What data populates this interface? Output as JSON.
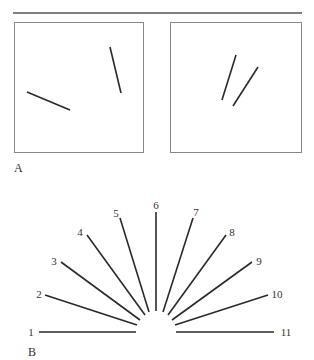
{
  "figure": {
    "top_rule": {
      "x1": 13,
      "y1": 13,
      "x2": 302,
      "y2": 13,
      "color": "#555555",
      "width": 1.3
    },
    "panel_a": {
      "label": "A",
      "label_pos": {
        "x": 14,
        "y": 172
      },
      "boxes": [
        {
          "name": "left-stimulus-box",
          "x": 14.5,
          "y": 22.5,
          "w": 129,
          "h": 130,
          "lines": [
            {
              "x1": 27,
              "y1": 92,
              "x2": 70,
              "y2": 110
            },
            {
              "x1": 110,
              "y1": 47,
              "x2": 121,
              "y2": 93
            }
          ]
        },
        {
          "name": "right-stimulus-box",
          "x": 170.5,
          "y": 22.5,
          "w": 131,
          "h": 130,
          "lines": [
            {
              "x1": 236,
              "y1": 55,
              "x2": 222,
              "y2": 100
            },
            {
              "x1": 258,
              "y1": 67,
              "x2": 233,
              "y2": 106
            }
          ]
        }
      ],
      "box_color": "#888888",
      "line_color": "#2a2a2a"
    },
    "panel_b": {
      "label": "B",
      "label_pos": {
        "x": 28,
        "y": 356
      },
      "line_color": "#2a2a2a",
      "fan_lines": [
        {
          "id": "1",
          "x1": 39,
          "y1": 332,
          "x2": 136,
          "y2": 332,
          "lx": 31,
          "ly": 336
        },
        {
          "id": "2",
          "x1": 45,
          "y1": 295,
          "x2": 137,
          "y2": 325,
          "lx": 39,
          "ly": 298
        },
        {
          "id": "3",
          "x1": 61,
          "y1": 262,
          "x2": 140,
          "y2": 320,
          "lx": 54,
          "ly": 265
        },
        {
          "id": "4",
          "x1": 87,
          "y1": 235,
          "x2": 145,
          "y2": 315,
          "lx": 80,
          "ly": 236
        },
        {
          "id": "5",
          "x1": 120,
          "y1": 218,
          "x2": 149,
          "y2": 312,
          "lx": 116,
          "ly": 217
        },
        {
          "id": "6",
          "x1": 156,
          "y1": 212,
          "x2": 156,
          "y2": 311,
          "lx": 156,
          "ly": 209
        },
        {
          "id": "7",
          "x1": 193,
          "y1": 218,
          "x2": 163,
          "y2": 312,
          "lx": 196,
          "ly": 216
        },
        {
          "id": "8",
          "x1": 226,
          "y1": 235,
          "x2": 168,
          "y2": 315,
          "lx": 232,
          "ly": 236
        },
        {
          "id": "9",
          "x1": 252,
          "y1": 262,
          "x2": 172,
          "y2": 320,
          "lx": 259,
          "ly": 265
        },
        {
          "id": "10",
          "x1": 268,
          "y1": 295,
          "x2": 175,
          "y2": 325,
          "lx": 277,
          "ly": 298
        },
        {
          "id": "11",
          "x1": 176,
          "y1": 332,
          "x2": 274,
          "y2": 332,
          "lx": 286,
          "ly": 336
        }
      ]
    }
  }
}
